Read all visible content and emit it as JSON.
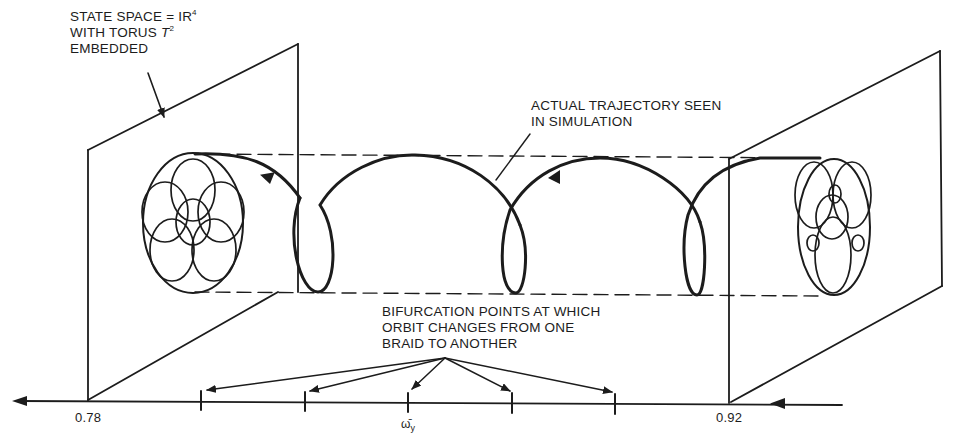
{
  "figure": {
    "labels": {
      "state_space": {
        "line1_text": "STATE SPACE = IR",
        "line1_sup": "4",
        "line2_text": "WITH TORUS ",
        "line2_italic": "T",
        "line2_sup": "2",
        "line3": "EMBEDDED"
      },
      "trajectory": {
        "line1": "ACTUAL TRAJECTORY SEEN",
        "line2": "IN SIMULATION"
      },
      "bifurcation": {
        "line1": "BIFURCATION POINTS AT WHICH",
        "line2": "ORBIT CHANGES FROM ONE",
        "line3": "BRAID TO ANOTHER"
      }
    },
    "axis": {
      "left_value": "0.78",
      "right_value": "0.92",
      "parameter_symbol": "ω̄",
      "parameter_subscript": "y",
      "tick_count": 5
    },
    "colors": {
      "ink": "#1c1c1c",
      "background": "#ffffff"
    }
  }
}
